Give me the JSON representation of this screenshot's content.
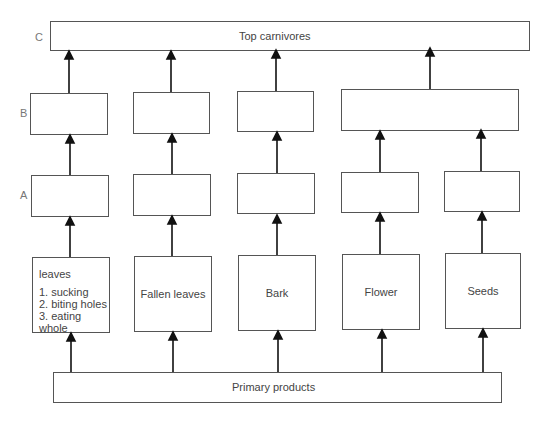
{
  "diagram": {
    "levels": {
      "c": "C",
      "b": "B",
      "a": "A"
    },
    "top": {
      "label": "Top carnivores"
    },
    "bottom": {
      "label": "Primary products"
    },
    "columns": [
      {
        "id": "leaves",
        "source_title": "leaves",
        "source_items": [
          "1. sucking",
          "2. biting holes",
          "3. eating whole"
        ]
      },
      {
        "id": "fallen-leaves",
        "source_title": "Fallen leaves"
      },
      {
        "id": "bark",
        "source_title": "Bark"
      },
      {
        "id": "flower",
        "source_title": "Flower"
      },
      {
        "id": "seeds",
        "source_title": "Seeds"
      }
    ],
    "notes": {
      "b_level": "Flower and Seeds columns share a single merged box at level B, with one arrow to Top carnivores"
    }
  }
}
